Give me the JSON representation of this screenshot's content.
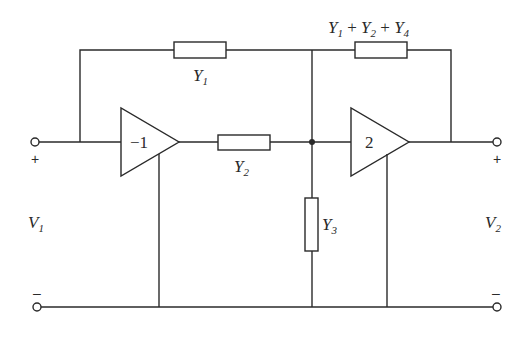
{
  "diagram": {
    "type": "circuit-schematic",
    "colors": {
      "line": "#2a2a2a",
      "background": "#ffffff"
    },
    "amplifiers": [
      {
        "id": "amp1",
        "gain_label": "−1"
      },
      {
        "id": "amp2",
        "gain_label": "2"
      }
    ],
    "admittances": [
      {
        "id": "y1",
        "base": "Y",
        "sub": "1"
      },
      {
        "id": "y2",
        "base": "Y",
        "sub": "2"
      },
      {
        "id": "y3",
        "base": "Y",
        "sub": "3"
      },
      {
        "id": "y124",
        "parts": [
          {
            "base": "Y",
            "sub": "1"
          },
          {
            "op": " + "
          },
          {
            "base": "Y",
            "sub": "2"
          },
          {
            "op": " + "
          },
          {
            "base": "Y",
            "sub": "4"
          }
        ]
      }
    ],
    "ports": {
      "input": {
        "base": "V",
        "sub": "1",
        "plus": "+",
        "minus": "–"
      },
      "output": {
        "base": "V",
        "sub": "2",
        "plus": "+",
        "minus": "–"
      }
    }
  }
}
